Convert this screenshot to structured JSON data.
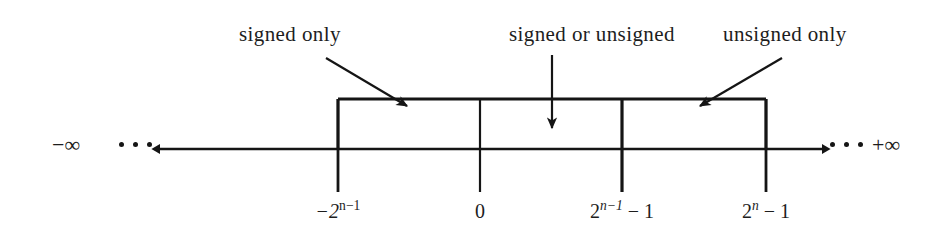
{
  "figure": {
    "type": "number-line-diagram",
    "line_color": "#151515",
    "text_color": "#1d1d1d",
    "background": "#ffffff"
  },
  "callouts": [
    {
      "id": "signed-only",
      "label": "signed only",
      "arrow": {
        "from_x": 326,
        "from_y": 58,
        "to_x": 407,
        "to_y": 106
      }
    },
    {
      "id": "signed-or-unsigned",
      "label": "signed or unsigned",
      "arrow": {
        "from_x": 552,
        "from_y": 55,
        "to_x": 552,
        "to_y": 128
      }
    },
    {
      "id": "unsigned-only",
      "label": "unsigned only",
      "arrow": {
        "from_x": 782,
        "from_y": 58,
        "to_x": 700,
        "to_y": 106
      }
    }
  ],
  "ticks": [
    {
      "id": "min-signed",
      "x": 338,
      "label_text": "−2^(n−1)",
      "base": "−2",
      "exponent": "n−1",
      "suffix": ""
    },
    {
      "id": "zero",
      "x": 480,
      "label_text": "0",
      "base": "0",
      "exponent": "",
      "suffix": ""
    },
    {
      "id": "max-signed",
      "x": 622,
      "label_text": "2^(n−1) − 1",
      "base": "2",
      "exponent": "n−1",
      "suffix": " − 1"
    },
    {
      "id": "max-unsigned",
      "x": 766,
      "label_text": "2^n − 1",
      "base": "2",
      "exponent": "n",
      "suffix": " − 1"
    }
  ],
  "endpoints": {
    "left": {
      "label": "−∞",
      "dots": 3,
      "arrow_direction": "left"
    },
    "right": {
      "label": "+∞",
      "dots": 3,
      "arrow_direction": "right"
    }
  },
  "axis": {
    "y": 149,
    "left_arrow_tip_x": 160,
    "right_arrow_tip_x": 822
  },
  "box": {
    "top_y": 99,
    "left_x": 338,
    "right_x": 766,
    "bottom_y": 149,
    "tick_bottom_y": 192,
    "tick_top_y": 99
  }
}
